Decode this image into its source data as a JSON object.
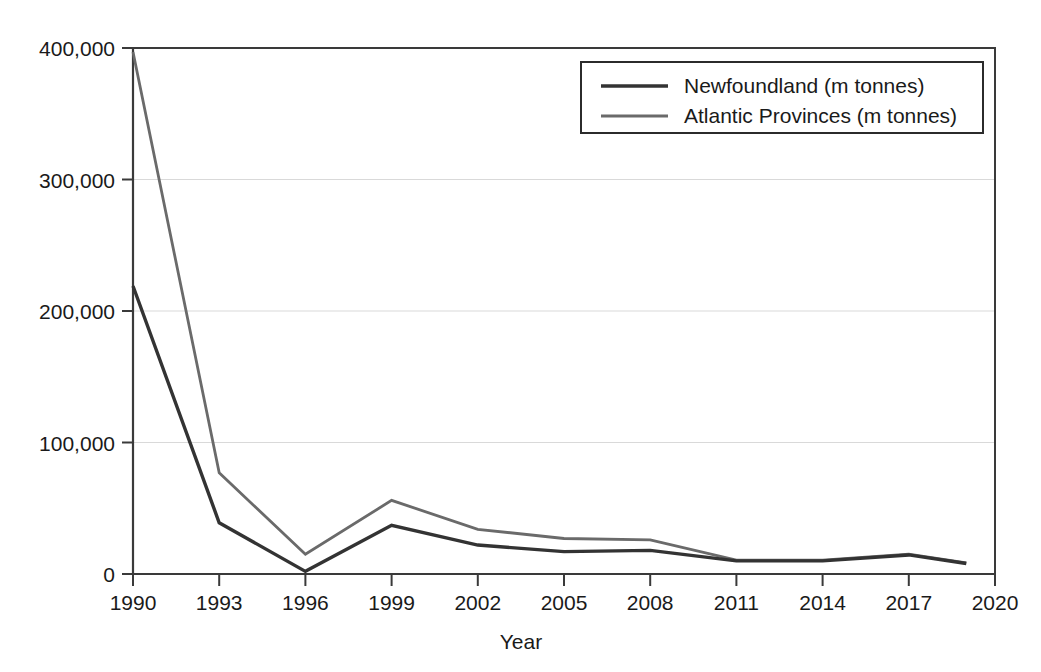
{
  "chart_data": {
    "type": "line",
    "title": "",
    "xlabel": "Year",
    "ylabel": "",
    "grid": "horizontal",
    "legend_position": "top-right",
    "xlim": [
      1990,
      2020
    ],
    "ylim": [
      0,
      400000
    ],
    "x_tick_labels": [
      "1990",
      "1993",
      "1996",
      "1999",
      "2002",
      "2005",
      "2008",
      "2011",
      "2014",
      "2017",
      "2020"
    ],
    "x_ticks": [
      1990,
      1993,
      1996,
      1999,
      2002,
      2005,
      2008,
      2011,
      2014,
      2017,
      2020
    ],
    "y_tick_labels": [
      "0",
      "100,000",
      "200,000",
      "300,000",
      "400,000"
    ],
    "y_ticks": [
      0,
      100000,
      200000,
      300000,
      400000
    ],
    "x": [
      1990,
      1993,
      1996,
      1999,
      2002,
      2005,
      2008,
      2011,
      2014,
      2017,
      2019
    ],
    "series": [
      {
        "name": "Newfoundland (m tonnes)",
        "color": "#333333",
        "width": 3.4,
        "values": [
          219000,
          39000,
          2000,
          37000,
          22000,
          17000,
          18000,
          10000,
          10000,
          14500,
          8000
        ]
      },
      {
        "name": "Atlantic Provinces (m tonnes)",
        "color": "#6a6a6a",
        "width": 2.8,
        "values": [
          397000,
          77000,
          15000,
          56000,
          34000,
          27000,
          26000,
          10500,
          10500,
          15000,
          8500
        ]
      }
    ]
  },
  "legend": {
    "items": [
      {
        "label": "Newfoundland (m tonnes)"
      },
      {
        "label": "Atlantic Provinces (m tonnes)"
      }
    ]
  },
  "axes": {
    "x_title": "Year"
  }
}
